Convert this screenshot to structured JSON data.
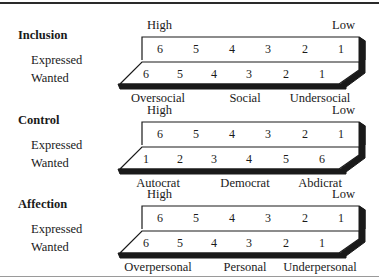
{
  "sections": [
    {
      "title": "Inclusion",
      "high_label": "High",
      "low_label": "Low",
      "expressed_label": "Expressed",
      "wanted_label": "Wanted",
      "expressed_scale": [
        "6",
        "5",
        "4",
        "3",
        "2",
        "1"
      ],
      "wanted_scale": [
        "6",
        "5",
        "4",
        "3",
        "2",
        "1"
      ],
      "categories": [
        "Oversocial",
        "Social",
        "Undersocial"
      ]
    },
    {
      "title": "Control",
      "high_label": "High",
      "low_label": "Low",
      "expressed_label": "Expressed",
      "wanted_label": "Wanted",
      "expressed_scale": [
        "6",
        "5",
        "4",
        "3",
        "2",
        "1"
      ],
      "wanted_scale": [
        "1",
        "2",
        "3",
        "4",
        "5",
        "6"
      ],
      "categories": [
        "Autocrat",
        "Democrat",
        "Abdicrat"
      ]
    },
    {
      "title": "Affection",
      "high_label": "High",
      "low_label": "Low",
      "expressed_label": "Expressed",
      "wanted_label": "Wanted",
      "expressed_scale": [
        "6",
        "5",
        "4",
        "3",
        "2",
        "1"
      ],
      "wanted_scale": [
        "6",
        "5",
        "4",
        "3",
        "2",
        "1"
      ],
      "categories": [
        "Overpersonal",
        "Personal",
        "Underpersonal"
      ]
    }
  ]
}
